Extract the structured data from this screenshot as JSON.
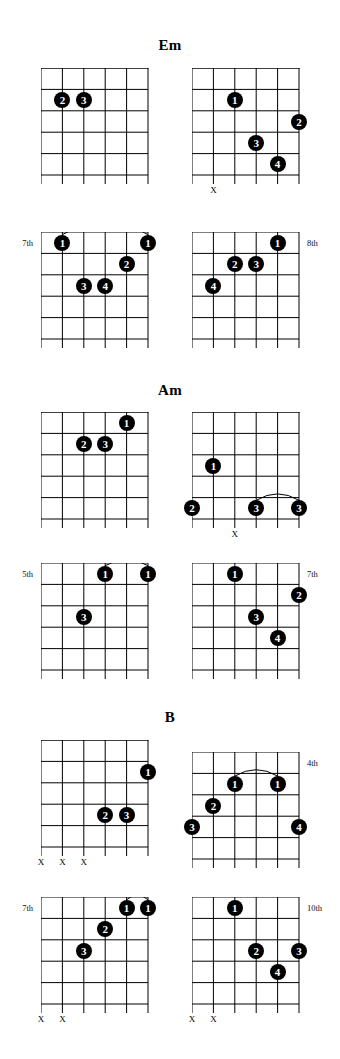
{
  "page": {
    "width": 340,
    "height": 1059,
    "ink": "#000000",
    "paper": "#ffffff"
  },
  "geometry": {
    "string_count": 6,
    "fret_count": 5,
    "grid_width": 107,
    "string_spacing": 21.4,
    "fret_spacing": 21.4,
    "note": "string index 1 = high E at right edge; index 6 = low E at left edge"
  },
  "chords": [
    {
      "name": "Em",
      "title_top": 38,
      "diagrams": [
        {
          "id": "em-1",
          "left": 41,
          "top": 68,
          "nut": true,
          "position_label": "",
          "position_side": "",
          "dots": [
            {
              "finger": "2",
              "string": 5,
              "fret": 2
            },
            {
              "finger": "3",
              "string": 4,
              "fret": 2
            }
          ],
          "barres": [],
          "x_marks": []
        },
        {
          "id": "em-2",
          "left": 192,
          "top": 68,
          "nut": true,
          "position_label": "",
          "position_side": "",
          "dots": [
            {
              "finger": "1",
              "string": 4,
              "fret": 2
            },
            {
              "finger": "2",
              "string": 1,
              "fret": 3
            },
            {
              "finger": "3",
              "string": 3,
              "fret": 4
            },
            {
              "finger": "4",
              "string": 2,
              "fret": 5
            }
          ],
          "barres": [],
          "x_marks": [
            5
          ]
        },
        {
          "id": "em-3",
          "left": 41,
          "top": 232,
          "nut": false,
          "position_label": "7th",
          "position_side": "left",
          "dots": [
            {
              "finger": "1",
              "string": 5,
              "fret": 1
            },
            {
              "finger": "1",
              "string": 1,
              "fret": 1
            },
            {
              "finger": "2",
              "string": 2,
              "fret": 2
            },
            {
              "finger": "3",
              "string": 4,
              "fret": 3
            },
            {
              "finger": "4",
              "string": 3,
              "fret": 3
            }
          ],
          "barres": [
            {
              "fret": 1,
              "from_string": 5,
              "to_string": 1
            }
          ],
          "x_marks": []
        },
        {
          "id": "em-4",
          "left": 192,
          "top": 232,
          "nut": false,
          "position_label": "8th",
          "position_side": "right",
          "dots": [
            {
              "finger": "1",
              "string": 2,
              "fret": 1
            },
            {
              "finger": "2",
              "string": 4,
              "fret": 2
            },
            {
              "finger": "3",
              "string": 3,
              "fret": 2
            },
            {
              "finger": "4",
              "string": 5,
              "fret": 3
            }
          ],
          "barres": [],
          "x_marks": []
        }
      ]
    },
    {
      "name": "Am",
      "title_top": 383,
      "diagrams": [
        {
          "id": "am-1",
          "left": 41,
          "top": 412,
          "nut": true,
          "position_label": "",
          "position_side": "",
          "dots": [
            {
              "finger": "1",
              "string": 2,
              "fret": 1
            },
            {
              "finger": "2",
              "string": 4,
              "fret": 2
            },
            {
              "finger": "3",
              "string": 3,
              "fret": 2
            }
          ],
          "barres": [],
          "x_marks": []
        },
        {
          "id": "am-2",
          "left": 192,
          "top": 412,
          "nut": true,
          "position_label": "",
          "position_side": "",
          "dots": [
            {
              "finger": "1",
              "string": 5,
              "fret": 3
            },
            {
              "finger": "2",
              "string": 6,
              "fret": 5
            },
            {
              "finger": "3",
              "string": 3,
              "fret": 5
            },
            {
              "finger": "3",
              "string": 1,
              "fret": 5
            }
          ],
          "barres": [
            {
              "fret": 5,
              "from_string": 3,
              "to_string": 1
            }
          ],
          "x_marks": [
            4
          ]
        },
        {
          "id": "am-3",
          "left": 41,
          "top": 563,
          "nut": false,
          "position_label": "5th",
          "position_side": "left",
          "dots": [
            {
              "finger": "1",
              "string": 3,
              "fret": 1
            },
            {
              "finger": "1",
              "string": 1,
              "fret": 1
            },
            {
              "finger": "3",
              "string": 4,
              "fret": 3
            }
          ],
          "barres": [
            {
              "fret": 1,
              "from_string": 3,
              "to_string": 1
            }
          ],
          "x_marks": []
        },
        {
          "id": "am-4",
          "left": 192,
          "top": 563,
          "nut": false,
          "position_label": "7th",
          "position_side": "right",
          "dots": [
            {
              "finger": "1",
              "string": 4,
              "fret": 1
            },
            {
              "finger": "2",
              "string": 1,
              "fret": 2
            },
            {
              "finger": "3",
              "string": 3,
              "fret": 3
            },
            {
              "finger": "4",
              "string": 2,
              "fret": 4
            }
          ],
          "barres": [],
          "x_marks": []
        }
      ]
    },
    {
      "name": "B",
      "title_top": 710,
      "diagrams": [
        {
          "id": "b-1",
          "left": 41,
          "top": 740,
          "nut": true,
          "position_label": "",
          "position_side": "",
          "dots": [
            {
              "finger": "1",
              "string": 1,
              "fret": 2
            },
            {
              "finger": "2",
              "string": 3,
              "fret": 4
            },
            {
              "finger": "3",
              "string": 2,
              "fret": 4
            }
          ],
          "barres": [],
          "x_marks": [
            6,
            5,
            4
          ]
        },
        {
          "id": "b-2",
          "left": 192,
          "top": 752,
          "nut": false,
          "position_label": "4th",
          "position_side": "right",
          "dots": [
            {
              "finger": "1",
              "string": 4,
              "fret": 2
            },
            {
              "finger": "1",
              "string": 2,
              "fret": 2
            },
            {
              "finger": "2",
              "string": 5,
              "fret": 3
            },
            {
              "finger": "3",
              "string": 6,
              "fret": 4
            },
            {
              "finger": "4",
              "string": 1,
              "fret": 4
            }
          ],
          "barres": [
            {
              "fret": 2,
              "from_string": 4,
              "to_string": 2
            }
          ],
          "x_marks": []
        },
        {
          "id": "b-3",
          "left": 41,
          "top": 897,
          "nut": false,
          "position_label": "7th",
          "position_side": "left",
          "dots": [
            {
              "finger": "1",
              "string": 2,
              "fret": 1
            },
            {
              "finger": "1",
              "string": 1,
              "fret": 1
            },
            {
              "finger": "2",
              "string": 3,
              "fret": 2
            },
            {
              "finger": "3",
              "string": 4,
              "fret": 3
            }
          ],
          "barres": [
            {
              "fret": 1,
              "from_string": 2,
              "to_string": 1
            }
          ],
          "x_marks": [
            6,
            5
          ]
        },
        {
          "id": "b-4",
          "left": 192,
          "top": 897,
          "nut": false,
          "position_label": "10th",
          "position_side": "right",
          "dots": [
            {
              "finger": "1",
              "string": 4,
              "fret": 1
            },
            {
              "finger": "2",
              "string": 3,
              "fret": 3
            },
            {
              "finger": "3",
              "string": 1,
              "fret": 3
            },
            {
              "finger": "4",
              "string": 2,
              "fret": 4
            }
          ],
          "barres": [],
          "x_marks": [
            6,
            5
          ]
        }
      ]
    }
  ],
  "x_symbol": "X"
}
